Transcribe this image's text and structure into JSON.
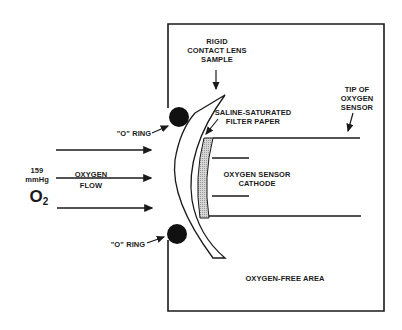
{
  "diagram": {
    "labels": {
      "lens_sample": [
        "RIGID",
        "CONTACT LENS",
        "SAMPLE"
      ],
      "tip_sensor": [
        "TIP OF",
        "OXYGEN",
        "SENSOR"
      ],
      "o_ring_top": "\"O\" RING",
      "o_ring_bottom": "\"O\" RING",
      "filter_paper": [
        "SALINE-SATURATED",
        "FILTER PAPER"
      ],
      "cathode": [
        "OXYGEN SENSOR",
        "CATHODE"
      ],
      "pressure_value": "159",
      "pressure_unit": "mmHg",
      "gas": "O",
      "gas_subscript": "2",
      "flow": [
        "OXYGEN",
        "FLOW"
      ],
      "oxygen_free": "OXYGEN-FREE AREA"
    },
    "colors": {
      "line": "#1a1a1a",
      "filter_fill": "#c8c8c8",
      "background": "#ffffff"
    }
  }
}
